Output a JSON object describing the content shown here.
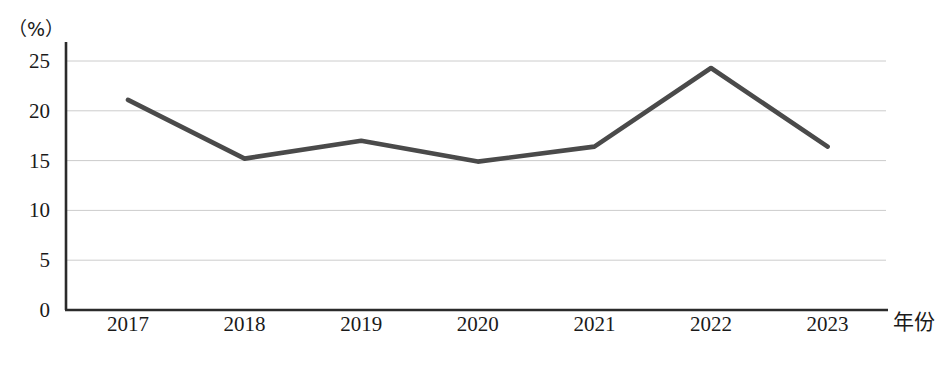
{
  "chart_data": {
    "type": "line",
    "title": "",
    "subtitle": "",
    "xlabel": "年份",
    "ylabel": "",
    "yunit": "（%）",
    "categories": [
      "2017",
      "2018",
      "2019",
      "2020",
      "2021",
      "2022",
      "2023"
    ],
    "series": [
      {
        "name": "",
        "values": [
          21.1,
          15.2,
          17.0,
          14.9,
          16.4,
          24.3,
          16.4
        ]
      }
    ],
    "ylim": [
      0,
      27
    ],
    "yticks": [
      0,
      5,
      10,
      15,
      20,
      25
    ],
    "ytick_labels": [
      "0",
      "5",
      "10",
      "15",
      "20",
      "25"
    ],
    "grid": "horizontal",
    "legend": "none",
    "line_color": "#4a4a4a",
    "axis_color": "#2b2b2b",
    "grid_color": "#cccccc"
  },
  "axes": {
    "y_unit_caption": "（%）",
    "x_axis_title": "年份"
  }
}
